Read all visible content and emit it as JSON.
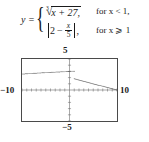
{
  "equation": {
    "lhs": "y =",
    "rows": [
      {
        "radical_index": "3",
        "radical_sign": "√",
        "radicand": "x + 27,",
        "condition": "for x < 1,"
      },
      {
        "expr_lead": "2",
        "expr_minus": "−",
        "frac_num": "x",
        "frac_den": "5",
        "expr_trail": ",",
        "condition": "for x ⩾ 1"
      }
    ]
  },
  "graph": {
    "labels": {
      "top": "5",
      "bottom": "−5",
      "left": "−10",
      "right": "10"
    }
  },
  "chart_data": {
    "type": "line",
    "title": "",
    "xlabel": "",
    "ylabel": "",
    "xlim": [
      -10,
      10
    ],
    "ylim": [
      -5,
      5
    ],
    "xtick_interval": 1,
    "ytick_interval": 1,
    "grid": false,
    "legend": false,
    "style": "dotted",
    "axis_labels_shown": [
      "5",
      "-5",
      "-10",
      "10"
    ],
    "series": [
      {
        "name": "cbrt(x + 27), x < 1",
        "formula": "y = (x + 27)^(1/3)",
        "domain": [
          -10,
          1
        ],
        "x": [
          -10,
          -9,
          -8,
          -7,
          -6,
          -5,
          -4,
          -3,
          -2,
          -1,
          0,
          1
        ],
        "y": [
          2.57,
          2.62,
          2.67,
          2.71,
          2.76,
          2.8,
          2.84,
          2.88,
          2.92,
          2.96,
          3.0,
          3.04
        ]
      },
      {
        "name": "|2 - x/5|, x >= 1",
        "formula": "y = |2 - x/5|",
        "domain": [
          1,
          10
        ],
        "x": [
          1,
          2,
          3,
          4,
          5,
          6,
          7,
          8,
          9,
          10
        ],
        "y": [
          1.8,
          1.6,
          1.4,
          1.2,
          1.0,
          0.8,
          0.6,
          0.4,
          0.2,
          0.0
        ]
      }
    ]
  }
}
